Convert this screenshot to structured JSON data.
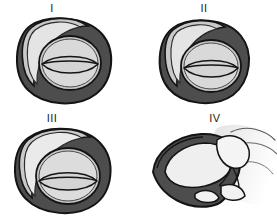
{
  "figure": {
    "background_color": "#ffffff",
    "width": 277,
    "height": 220,
    "panel_count": 4
  },
  "palette": {
    "outline": "#1a1a1a",
    "outer_ring_dark": "#4d4d4d",
    "outer_ring_shadow": "#3a3a3a",
    "mid_gray": "#8f8f8f",
    "inner_light": "#c9c9c9",
    "inner_lighter": "#d9d9d9",
    "highlight": "#e9e9e9",
    "tissue_light": "#efefef",
    "tissue_pale": "#f7f7f7",
    "label_text": "#1c1c1c"
  },
  "panels": [
    {
      "id": "panel-1",
      "label": "I",
      "caption": "",
      "style": "schematic",
      "description": "Dark annular rim with crescent highlight at upper left and a centered lens-shaped aperture",
      "lens_vertical_offset": 0
    },
    {
      "id": "panel-2",
      "label": "II",
      "caption": "",
      "style": "schematic",
      "description": "Dark annular rim, thinner crescent at upper left, lens-shaped aperture shifted slightly lower",
      "lens_vertical_offset": 3
    },
    {
      "id": "panel-3",
      "label": "III",
      "caption": "",
      "style": "schematic",
      "description": "Dark annular rim with broad pale crescent at upper left and a large low-set lens aperture",
      "lens_vertical_offset": 6
    },
    {
      "id": "panel-4",
      "label": "IV",
      "caption": "",
      "style": "anatomical",
      "description": "Detailed shaded anatomical rendering: dark C-shaped body enclosing pale tissue lobes with soft gradient surrounding structures at right",
      "lens_vertical_offset": 0
    }
  ]
}
